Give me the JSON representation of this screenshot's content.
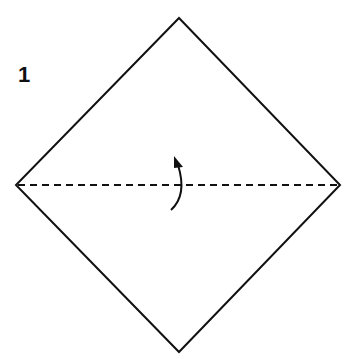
{
  "step": {
    "number": "1"
  },
  "diagram": {
    "shape": "square-diamond",
    "vertices": {
      "top": [
        179,
        18
      ],
      "right": [
        340,
        185
      ],
      "bottom": [
        179,
        352
      ],
      "left": [
        16,
        185
      ]
    },
    "fold_line": {
      "style": "valley-fold-dashed",
      "from": [
        16,
        185
      ],
      "to": [
        340,
        185
      ]
    },
    "arrow": {
      "direction": "fold-up",
      "icon": "curved-arrow-icon"
    },
    "stroke_color": "#111111",
    "background": "#ffffff"
  }
}
